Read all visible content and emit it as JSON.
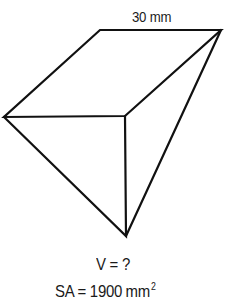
{
  "figure": {
    "type": "triangular prism (3D solid)",
    "stroke_color": "#111111",
    "fill_color": "#ffffff",
    "vertices": {
      "top_left": [
        100,
        30
      ],
      "top_right": [
        221,
        30
      ],
      "left": [
        4,
        117
      ],
      "front_right": [
        125,
        116
      ],
      "bottom": [
        126,
        236
      ]
    }
  },
  "labels": {
    "dimension": {
      "value": "30",
      "unit": "mm"
    },
    "volume": {
      "text": "V = ?"
    },
    "surface_area": {
      "prefix": "SA = 1900",
      "unit": "mm",
      "exponent": "2"
    }
  }
}
